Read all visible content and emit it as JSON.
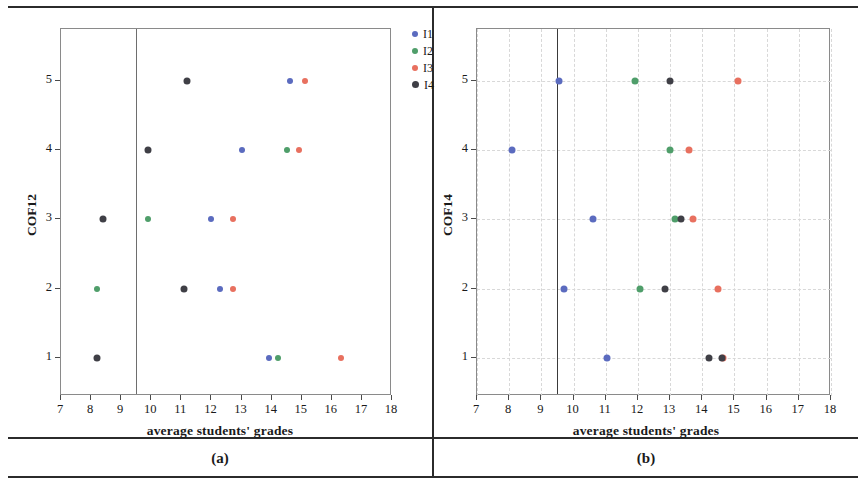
{
  "figure": {
    "captions": [
      {
        "label": "(a)"
      },
      {
        "label": "(b)"
      }
    ]
  },
  "legend": {
    "position": "top-right",
    "items": [
      {
        "label": "I1",
        "color": "#5b6bbf"
      },
      {
        "label": "I2",
        "color": "#4f9e6a"
      },
      {
        "label": "I3",
        "color": "#e8705f"
      },
      {
        "label": "I4",
        "color": "#3f3f46"
      }
    ]
  },
  "chart_data": [
    {
      "type": "scatter",
      "panel": "a",
      "title": "",
      "xlabel": "average students' grades",
      "ylabel": "COF12",
      "xlim": [
        7,
        18
      ],
      "ylim": [
        0.45,
        5.75
      ],
      "xticks": [
        7,
        8,
        9,
        10,
        11,
        12,
        13,
        14,
        15,
        16,
        17,
        18
      ],
      "yticks": [
        1,
        2,
        3,
        4,
        5
      ],
      "grid": false,
      "threshold_x": 9.5,
      "series": [
        {
          "name": "I1",
          "color": "#5b6bbf",
          "points": [
            {
              "x": 14.6,
              "y": 5
            },
            {
              "x": 13.0,
              "y": 4
            },
            {
              "x": 12.0,
              "y": 3
            },
            {
              "x": 12.3,
              "y": 2
            },
            {
              "x": 13.9,
              "y": 1
            }
          ]
        },
        {
          "name": "I2",
          "color": "#4f9e6a",
          "points": [
            {
              "x": 14.5,
              "y": 4
            },
            {
              "x": 9.9,
              "y": 3
            },
            {
              "x": 8.2,
              "y": 2
            },
            {
              "x": 14.2,
              "y": 1
            }
          ]
        },
        {
          "name": "I3",
          "color": "#e8705f",
          "points": [
            {
              "x": 15.1,
              "y": 5
            },
            {
              "x": 14.9,
              "y": 4
            },
            {
              "x": 12.7,
              "y": 3
            },
            {
              "x": 12.7,
              "y": 2
            },
            {
              "x": 16.3,
              "y": 1
            }
          ]
        },
        {
          "name": "I4",
          "color": "#3f3f46",
          "points": [
            {
              "x": 11.2,
              "y": 5
            },
            {
              "x": 9.9,
              "y": 4
            },
            {
              "x": 8.4,
              "y": 3
            },
            {
              "x": 11.1,
              "y": 2
            },
            {
              "x": 8.2,
              "y": 1
            }
          ]
        }
      ]
    },
    {
      "type": "scatter",
      "panel": "b",
      "title": "",
      "xlabel": "average students' grades",
      "ylabel": "COF14",
      "xlim": [
        7,
        18
      ],
      "ylim": [
        0.45,
        5.75
      ],
      "xticks": [
        7,
        8,
        9,
        10,
        11,
        12,
        13,
        14,
        15,
        16,
        17,
        18
      ],
      "yticks": [
        1,
        2,
        3,
        4,
        5
      ],
      "grid": true,
      "threshold_x": 9.5,
      "series": [
        {
          "name": "I1",
          "color": "#5b6bbf",
          "points": [
            {
              "x": 9.55,
              "y": 5
            },
            {
              "x": 8.1,
              "y": 4
            },
            {
              "x": 10.6,
              "y": 3
            },
            {
              "x": 9.7,
              "y": 2
            },
            {
              "x": 11.05,
              "y": 1
            }
          ]
        },
        {
          "name": "I2",
          "color": "#4f9e6a",
          "points": [
            {
              "x": 11.9,
              "y": 5
            },
            {
              "x": 13.0,
              "y": 4
            },
            {
              "x": 13.15,
              "y": 3
            },
            {
              "x": 12.05,
              "y": 2
            }
          ]
        },
        {
          "name": "I3",
          "color": "#e8705f",
          "points": [
            {
              "x": 15.1,
              "y": 5
            },
            {
              "x": 13.6,
              "y": 4
            },
            {
              "x": 13.7,
              "y": 3
            },
            {
              "x": 14.5,
              "y": 2
            },
            {
              "x": 14.65,
              "y": 1
            }
          ]
        },
        {
          "name": "I4",
          "color": "#3f3f46",
          "points": [
            {
              "x": 13.0,
              "y": 5
            },
            {
              "x": 13.35,
              "y": 3
            },
            {
              "x": 12.85,
              "y": 2
            },
            {
              "x": 14.2,
              "y": 1
            },
            {
              "x": 14.6,
              "y": 1
            }
          ]
        }
      ]
    }
  ]
}
